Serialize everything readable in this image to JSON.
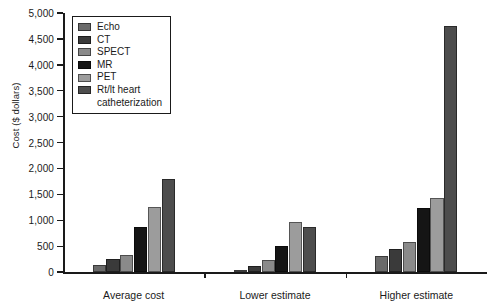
{
  "chart_data": {
    "type": "bar",
    "title": "",
    "xlabel": "",
    "ylabel": "Cost ($ dollars)",
    "categories": [
      "Average cost",
      "Lower estimate",
      "Higher estimate"
    ],
    "ylim": [
      0,
      5000
    ],
    "ytick_values": [
      0,
      500,
      1000,
      1500,
      2000,
      2500,
      3000,
      3500,
      4000,
      4500,
      5000
    ],
    "ytick_labels": [
      "0",
      "500",
      "1,000",
      "1,500",
      "2,000",
      "2,500",
      "3,000",
      "3,500",
      "4,000",
      "4,500",
      "5,000"
    ],
    "grid": false,
    "legend_position": "upper-left-inside",
    "series": [
      {
        "name": "Echo",
        "color": "#6a6a6a",
        "values": [
          135,
          40,
          310
        ]
      },
      {
        "name": "CT",
        "color": "#3a3a3a",
        "values": [
          250,
          110,
          450
        ]
      },
      {
        "name": "SPECT",
        "color": "#8a8a8a",
        "values": [
          330,
          240,
          570
        ]
      },
      {
        "name": "MR",
        "color": "#151515",
        "values": [
          870,
          500,
          1230
        ]
      },
      {
        "name": "PET",
        "color": "#9c9c9c",
        "values": [
          1250,
          960,
          1430
        ]
      },
      {
        "name": "Rt/lt heart catheterization",
        "color": "#4d4d4d",
        "values": [
          1790,
          860,
          4750
        ]
      }
    ]
  },
  "legend": {
    "items": [
      {
        "label": "Echo",
        "label2": ""
      },
      {
        "label": "CT",
        "label2": ""
      },
      {
        "label": "SPECT",
        "label2": ""
      },
      {
        "label": "MR",
        "label2": ""
      },
      {
        "label": "PET",
        "label2": ""
      },
      {
        "label": "Rt/lt heart",
        "label2": "catheterization"
      }
    ]
  }
}
